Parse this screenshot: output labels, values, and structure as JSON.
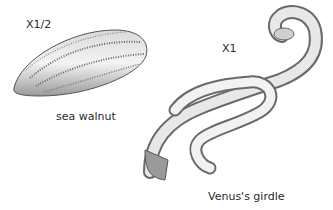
{
  "figure": {
    "items": [
      {
        "name": "sea walnut",
        "scale": "X1/2"
      },
      {
        "name": "Venus's girdle",
        "scale": "X1"
      }
    ]
  }
}
